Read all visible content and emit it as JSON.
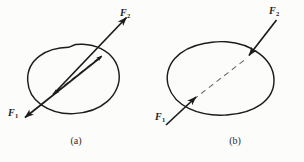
{
  "figure": {
    "background_color": "#fcfcfa",
    "ink_color": "#1c1c1c",
    "panels": [
      {
        "id": "a",
        "caption": "(a)",
        "description": "irregular closed body with two collinear forces directed outward along the dashed line of action",
        "labels": [
          {
            "name": "F",
            "subscript": "2",
            "position": "upper-right",
            "arrow_direction": "outward-up-right"
          },
          {
            "name": "F",
            "subscript": "1",
            "position": "lower-left",
            "arrow_direction": "outward-down-left"
          }
        ]
      },
      {
        "id": "b",
        "caption": "(b)",
        "description": "irregular closed body with two collinear forces directed inward along the dashed line of action",
        "labels": [
          {
            "name": "F",
            "subscript": "2",
            "position": "upper-right",
            "arrow_direction": "inward-down-left"
          },
          {
            "name": "F",
            "subscript": "1",
            "position": "lower-left",
            "arrow_direction": "inward-up-right"
          }
        ]
      }
    ]
  },
  "labels": {
    "a_f2_name": "F",
    "a_f2_sub": "2",
    "a_f1_name": "F",
    "a_f1_sub": "1",
    "a_caption": "(a)",
    "b_f2_name": "F",
    "b_f2_sub": "2",
    "b_f1_name": "F",
    "b_f1_sub": "1",
    "b_caption": "(b)"
  }
}
